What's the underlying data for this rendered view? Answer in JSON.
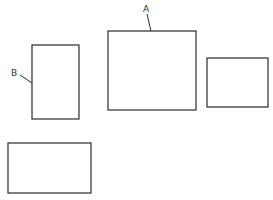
{
  "diagram": {
    "background": "#ffffff",
    "stroke_color": "#2a2a2a",
    "shapes": [
      {
        "id": "rect-a",
        "label": "A",
        "x": 108,
        "y": 31,
        "w": 88,
        "h": 79
      },
      {
        "id": "rect-b",
        "label": "B",
        "x": 32,
        "y": 45,
        "w": 47,
        "h": 74
      },
      {
        "id": "rect-right",
        "label": "",
        "x": 207,
        "y": 58,
        "w": 61,
        "h": 49
      },
      {
        "id": "rect-bottom",
        "label": "",
        "x": 8,
        "y": 143,
        "w": 83,
        "h": 50
      }
    ],
    "labels": {
      "a": "A",
      "b": "B"
    }
  }
}
